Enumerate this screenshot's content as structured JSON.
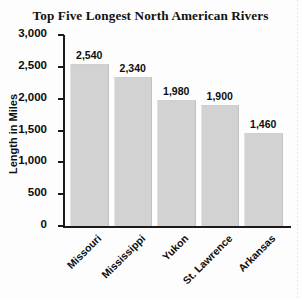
{
  "chart_data": {
    "type": "bar",
    "title": "Top Five Longest North American Rivers",
    "xlabel": "",
    "ylabel": "Length in Miles",
    "categories": [
      "Missouri",
      "Mississippi",
      "Yukon",
      "St. Lawrence",
      "Arkansas"
    ],
    "values": [
      2540,
      2340,
      1980,
      1900,
      1460
    ],
    "value_labels": [
      "2,540",
      "2,340",
      "1,980",
      "1,900",
      "1,460"
    ],
    "ylim": [
      0,
      3000
    ],
    "ytick_values": [
      0,
      500,
      1000,
      1500,
      2000,
      2500,
      3000
    ],
    "ytick_labels": [
      "0",
      "500",
      "1,000",
      "1,500",
      "2,000",
      "2,500",
      "3,000"
    ],
    "grid": false,
    "legend": false,
    "legend_position": "none",
    "bar_color": "#d2d2d2",
    "axis_color": "#1a1a1a",
    "text_color": "#0d0d0d",
    "background_color": "#fdfdfd",
    "xtick_label_rotation": 45
  }
}
